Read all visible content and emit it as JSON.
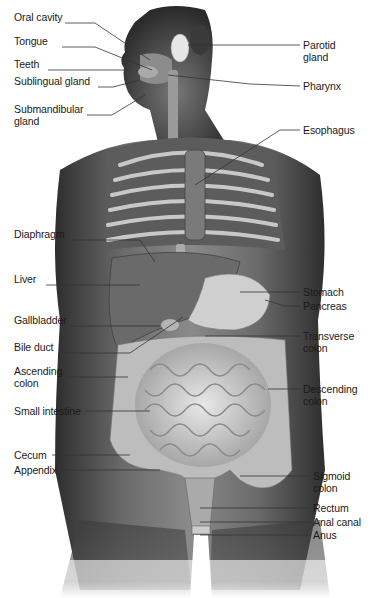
{
  "diagram": {
    "type": "anatomical",
    "labels_left": [
      {
        "id": "oral-cavity",
        "text": "Oral cavity",
        "x": 14,
        "y": 17
      },
      {
        "id": "tongue",
        "text": "Tongue",
        "x": 14,
        "y": 41
      },
      {
        "id": "teeth",
        "text": "Teeth",
        "x": 14,
        "y": 64
      },
      {
        "id": "sublingual-gland",
        "text": "Sublingual gland",
        "x": 14,
        "y": 81
      },
      {
        "id": "submandibular-gland",
        "text": "Submandibular\ngland",
        "x": 14,
        "y": 109
      },
      {
        "id": "diaphragm",
        "text": "Diaphragm",
        "x": 14,
        "y": 234
      },
      {
        "id": "liver",
        "text": "Liver",
        "x": 14,
        "y": 279
      },
      {
        "id": "gallbladder",
        "text": "Gallbladder",
        "x": 14,
        "y": 320
      },
      {
        "id": "bile-duct",
        "text": "Bile duct",
        "x": 14,
        "y": 347
      },
      {
        "id": "ascending-colon",
        "text": "Ascending\ncolon",
        "x": 14,
        "y": 371
      },
      {
        "id": "small-intestine",
        "text": "Small intestine",
        "x": 14,
        "y": 405
      },
      {
        "id": "cecum",
        "text": "Cecum",
        "x": 14,
        "y": 450
      },
      {
        "id": "appendix",
        "text": "Appendix",
        "x": 14,
        "y": 465
      }
    ],
    "labels_right": [
      {
        "id": "parotid-gland",
        "text": "Parotid\ngland",
        "x": 303,
        "y": 39
      },
      {
        "id": "pharynx",
        "text": "Pharynx",
        "x": 303,
        "y": 81
      },
      {
        "id": "esophagus",
        "text": "Esophagus",
        "x": 303,
        "y": 125
      },
      {
        "id": "stomach",
        "text": "Stomach",
        "x": 303,
        "y": 286
      },
      {
        "id": "pancreas",
        "text": "Pancreas",
        "x": 303,
        "y": 300
      },
      {
        "id": "transverse-colon",
        "text": "Transverse\ncolon",
        "x": 303,
        "y": 330
      },
      {
        "id": "descending-colon",
        "text": "Descending\ncolon",
        "x": 303,
        "y": 383
      },
      {
        "id": "sigmoid-colon",
        "text": "Sigmoid\ncolon",
        "x": 313,
        "y": 474
      },
      {
        "id": "rectum",
        "text": "Rectum",
        "x": 313,
        "y": 503
      },
      {
        "id": "anal-canal",
        "text": "Anal canal",
        "x": 313,
        "y": 517
      },
      {
        "id": "anus",
        "text": "Anus",
        "x": 313,
        "y": 530
      }
    ]
  },
  "colors": {
    "background": "#ffffff",
    "skin_dark": "#4a4a4a",
    "skin_mid": "#7a7a7a",
    "organ_light": "#d8d8d8",
    "leader_line": "#333333",
    "label_text": "#1a1a1a"
  }
}
